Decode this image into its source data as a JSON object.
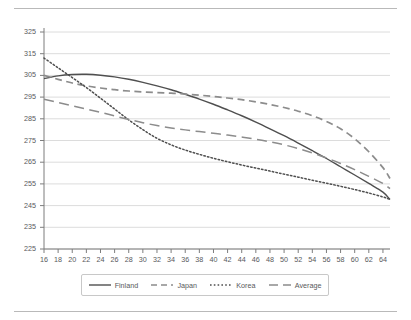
{
  "chart_data": {
    "type": "line",
    "title": "",
    "subtitle": "",
    "xlabel": "",
    "ylabel": "",
    "xlim": [
      16,
      65
    ],
    "ylim": [
      225,
      325
    ],
    "ytick_step": 10,
    "xtick_step": 2,
    "grid": "horizontal",
    "legend_position": "bottom-center",
    "x_ticks": [
      16,
      18,
      20,
      22,
      24,
      26,
      28,
      30,
      32,
      34,
      36,
      38,
      40,
      42,
      44,
      46,
      48,
      50,
      52,
      54,
      56,
      58,
      60,
      62,
      64
    ],
    "y_ticks": [
      225,
      235,
      245,
      255,
      265,
      275,
      285,
      295,
      305,
      315,
      325
    ],
    "x": [
      16,
      18,
      20,
      22,
      24,
      26,
      28,
      30,
      32,
      34,
      36,
      38,
      40,
      42,
      44,
      46,
      48,
      50,
      52,
      54,
      56,
      58,
      60,
      62,
      64,
      65
    ],
    "series": [
      {
        "name": "Finland",
        "style": "solid",
        "color": "#4f4f4f",
        "values": [
          303.5,
          304.8,
          305.4,
          305.5,
          305.1,
          304.3,
          303.2,
          301.8,
          300.2,
          298.4,
          296.3,
          294.1,
          291.7,
          289.1,
          286.4,
          283.5,
          280.4,
          277.2,
          273.8,
          270.3,
          266.7,
          262.9,
          259.1,
          255.2,
          251.2,
          247.8
        ]
      },
      {
        "name": "Japan",
        "style": "dashed",
        "color": "#8c8c8c",
        "values": [
          305.0,
          303.2,
          301.5,
          300.2,
          299.2,
          298.4,
          297.8,
          297.4,
          297.1,
          296.8,
          296.4,
          295.9,
          295.3,
          294.6,
          293.8,
          292.8,
          291.6,
          290.2,
          288.5,
          286.4,
          283.8,
          280.4,
          275.8,
          269.8,
          262.5,
          257.5
        ]
      },
      {
        "name": "Korea",
        "style": "dotted",
        "color": "#4f4f4f",
        "values": [
          313.0,
          308.5,
          304.0,
          299.4,
          294.5,
          289.5,
          284.5,
          280.0,
          276.0,
          273.0,
          270.6,
          268.6,
          266.8,
          265.2,
          263.7,
          262.3,
          260.9,
          259.5,
          258.1,
          256.7,
          255.3,
          253.9,
          252.4,
          250.8,
          249.0,
          247.8
        ]
      },
      {
        "name": "Average",
        "style": "longdash",
        "color": "#8c8c8c",
        "values": [
          294.0,
          292.5,
          291.0,
          289.5,
          288.0,
          286.3,
          284.7,
          283.2,
          281.9,
          280.8,
          279.9,
          279.1,
          278.3,
          277.5,
          276.6,
          275.6,
          274.4,
          273.0,
          271.3,
          269.3,
          267.0,
          264.4,
          261.6,
          258.5,
          255.2,
          252.8
        ]
      }
    ]
  },
  "legend": {
    "items": [
      {
        "label": "Finland",
        "swatch": "solid-line-swatch"
      },
      {
        "label": "Japan",
        "swatch": "dashed-line-swatch"
      },
      {
        "label": "Korea",
        "swatch": "dotted-line-swatch"
      },
      {
        "label": "Average",
        "swatch": "longdash-line-swatch"
      }
    ]
  }
}
